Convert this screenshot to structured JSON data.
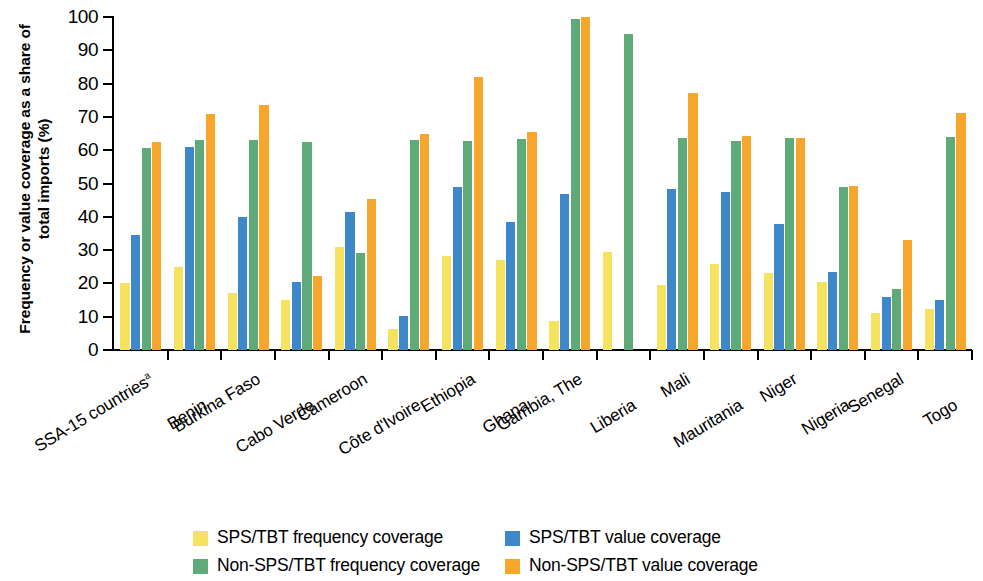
{
  "chart_data": {
    "type": "bar",
    "title": "",
    "xlabel": "",
    "ylabel": "Frequency or value coverage as a share of total imports (%)",
    "ylim": [
      0,
      100
    ],
    "ytick_labels": [
      "0",
      "10",
      "20",
      "30",
      "40",
      "50",
      "60",
      "70",
      "80",
      "90",
      "100"
    ],
    "ytick_values": [
      0,
      10,
      20,
      30,
      40,
      50,
      60,
      70,
      80,
      90,
      100
    ],
    "grid": false,
    "legend_position": "bottom",
    "categories": [
      "SSA-15 countriesᵃ",
      "Benin",
      "Burkina Faso",
      "Cabo Verde",
      "Cameroon",
      "Côte d'Ivoire",
      "Ethiopia",
      "Ghana",
      "Gambia, The",
      "Liberia",
      "Mali",
      "Mauritania",
      "Niger",
      "Nigeria",
      "Senegal",
      "Togo"
    ],
    "series": [
      {
        "name": "SPS/TBT frequency coverage",
        "color": "#F5E25F",
        "values": [
          20.0,
          25.0,
          17.2,
          15.0,
          30.8,
          6.2,
          28.2,
          27.0,
          8.8,
          29.5,
          19.5,
          25.8,
          23.0,
          20.5,
          11.0,
          12.2
        ]
      },
      {
        "name": "SPS/TBT value coverage",
        "color": "#3E87C8",
        "values": [
          34.6,
          61.0,
          39.8,
          20.4,
          41.5,
          10.2,
          49.0,
          38.5,
          47.0,
          null,
          48.4,
          47.4,
          37.8,
          23.5,
          16.0,
          15.0
        ]
      },
      {
        "name": "Non-SPS/TBT frequency coverage",
        "color": "#5EAA79",
        "values": [
          60.8,
          63.0,
          63.2,
          62.6,
          29.2,
          63.2,
          62.8,
          63.4,
          99.5,
          94.8,
          63.6,
          62.8,
          63.7,
          49.0,
          18.4,
          64.0
        ]
      },
      {
        "name": "Non-SPS/TBT value coverage",
        "color": "#F5A62B",
        "values": [
          62.4,
          71.0,
          73.6,
          22.2,
          45.5,
          65.0,
          82.0,
          65.5,
          100.0,
          null,
          77.2,
          64.2,
          63.6,
          49.4,
          33.0,
          71.2
        ]
      }
    ]
  },
  "legend": {
    "items": [
      {
        "label": "SPS/TBT frequency coverage",
        "color": "#F5E25F"
      },
      {
        "label": "SPS/TBT value coverage",
        "color": "#3E87C8"
      },
      {
        "label": "Non-SPS/TBT frequency coverage",
        "color": "#5EAA79"
      },
      {
        "label": "Non-SPS/TBT value coverage",
        "color": "#F5A62B"
      }
    ]
  }
}
